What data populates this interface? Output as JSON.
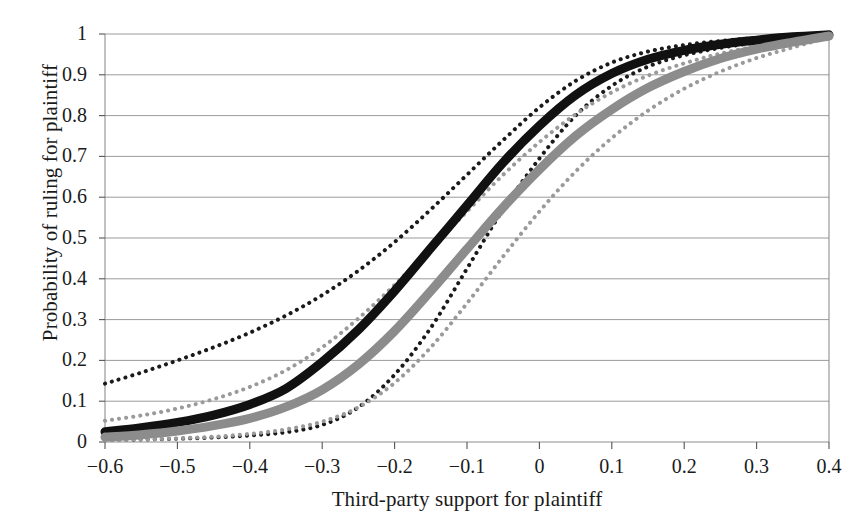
{
  "chart_data": {
    "type": "line",
    "title": "",
    "xlabel": "Third-party support for plaintiff",
    "ylabel": "Probability of ruling for plaintiff",
    "xlim": [
      -0.6,
      0.4
    ],
    "ylim": [
      0,
      1
    ],
    "xticks": [
      "−0.6",
      "−0.5",
      "−0.4",
      "−0.3",
      "−0.2",
      "−0.1",
      "0",
      "0.1",
      "0.2",
      "0.3",
      "0.4"
    ],
    "xtick_values": [
      -0.6,
      -0.5,
      -0.4,
      -0.3,
      -0.2,
      -0.1,
      0,
      0.1,
      0.2,
      0.3,
      0.4
    ],
    "yticks": [
      "0",
      "0.1",
      "0.2",
      "0.3",
      "0.4",
      "0.5",
      "0.6",
      "0.7",
      "0.8",
      "0.9",
      "1"
    ],
    "ytick_values": [
      0,
      0.1,
      0.2,
      0.3,
      0.4,
      0.5,
      0.6,
      0.7,
      0.8,
      0.9,
      1
    ],
    "grid": "horizontal",
    "legend": "none",
    "x": [
      -0.6,
      -0.55,
      -0.5,
      -0.45,
      -0.4,
      -0.35,
      -0.3,
      -0.25,
      -0.2,
      -0.15,
      -0.1,
      -0.05,
      0,
      0.05,
      0.1,
      0.15,
      0.2,
      0.25,
      0.3,
      0.35,
      0.4
    ],
    "series": [
      {
        "name": "black-estimate",
        "style": "solid-thick",
        "color": "#111111",
        "width": 9,
        "values": [
          0.025,
          0.035,
          0.048,
          0.066,
          0.092,
          0.131,
          0.196,
          0.275,
          0.37,
          0.475,
          0.58,
          0.685,
          0.775,
          0.85,
          0.903,
          0.938,
          0.96,
          0.975,
          0.985,
          0.993,
          0.998
        ]
      },
      {
        "name": "black-upper-bound",
        "style": "dotted",
        "color": "#1a1a1a",
        "width": 4,
        "values": [
          0.143,
          0.17,
          0.2,
          0.232,
          0.268,
          0.31,
          0.36,
          0.42,
          0.49,
          0.57,
          0.655,
          0.74,
          0.82,
          0.885,
          0.93,
          0.957,
          0.973,
          0.983,
          0.99,
          0.995,
          0.999
        ]
      },
      {
        "name": "black-lower-bound",
        "style": "dotted",
        "color": "#1a1a1a",
        "width": 4,
        "values": [
          0.005,
          0.006,
          0.008,
          0.011,
          0.016,
          0.024,
          0.042,
          0.085,
          0.165,
          0.28,
          0.425,
          0.57,
          0.695,
          0.8,
          0.873,
          0.92,
          0.948,
          0.966,
          0.979,
          0.989,
          0.997
        ]
      },
      {
        "name": "gray-estimate",
        "style": "solid-thick",
        "color": "#8c8c8c",
        "width": 9,
        "values": [
          0.012,
          0.018,
          0.027,
          0.04,
          0.058,
          0.086,
          0.128,
          0.19,
          0.272,
          0.37,
          0.473,
          0.575,
          0.668,
          0.75,
          0.815,
          0.868,
          0.908,
          0.94,
          0.963,
          0.98,
          0.995
        ]
      },
      {
        "name": "gray-upper-bound",
        "style": "dotted",
        "color": "#9a9a9a",
        "width": 4,
        "values": [
          0.052,
          0.065,
          0.082,
          0.105,
          0.135,
          0.176,
          0.232,
          0.303,
          0.385,
          0.475,
          0.565,
          0.655,
          0.735,
          0.803,
          0.857,
          0.898,
          0.928,
          0.952,
          0.97,
          0.984,
          0.996
        ]
      },
      {
        "name": "gray-lower-bound",
        "style": "dotted",
        "color": "#9a9a9a",
        "width": 4,
        "values": [
          0.004,
          0.006,
          0.009,
          0.013,
          0.02,
          0.031,
          0.05,
          0.085,
          0.145,
          0.232,
          0.34,
          0.455,
          0.565,
          0.663,
          0.745,
          0.812,
          0.866,
          0.908,
          0.941,
          0.967,
          0.992
        ]
      }
    ]
  },
  "axis": {
    "xlabel": "Third-party support for plaintiff",
    "ylabel": "Probability of ruling for plaintiff"
  }
}
